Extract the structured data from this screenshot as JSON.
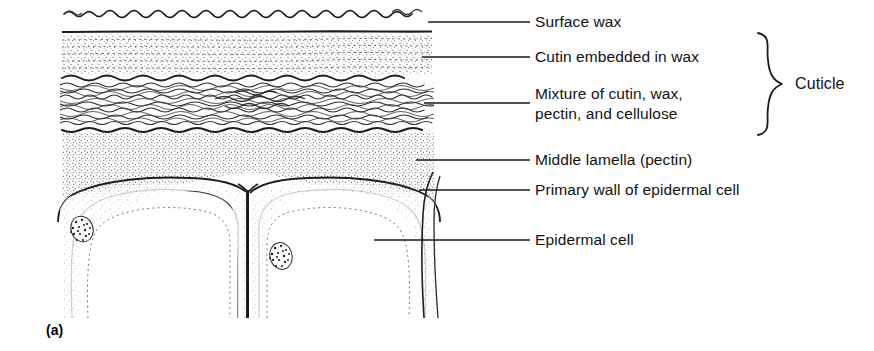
{
  "figure": {
    "panel_label": "(a)",
    "group_bracket_label": "Cuticle",
    "labels": [
      {
        "id": "surface-wax",
        "text": "Surface wax"
      },
      {
        "id": "cutin",
        "text": "Cutin embedded in wax"
      },
      {
        "id": "mixture-line1",
        "text": "Mixture of cutin, wax,"
      },
      {
        "id": "mixture-line2",
        "text": "pectin, and cellulose"
      },
      {
        "id": "middle-lamella",
        "text": "Middle lamella (pectin)"
      },
      {
        "id": "primary-wall",
        "text": "Primary wall of epidermal cell"
      },
      {
        "id": "epidermal-cell",
        "text": "Epidermal cell"
      }
    ],
    "structures": [
      {
        "id": "surface-wax-layer",
        "name": "wavy surface wax line"
      },
      {
        "id": "cutin-layer",
        "name": "stippled cutin-in-wax band"
      },
      {
        "id": "mixture-layer",
        "name": "dense wavy fiber band"
      },
      {
        "id": "pectin-layer",
        "name": "stippled middle lamella zone"
      },
      {
        "id": "epidermal-cell-left",
        "name": "left epidermal cell"
      },
      {
        "id": "epidermal-cell-right",
        "name": "right epidermal cell"
      },
      {
        "id": "nucleus-left",
        "name": "left cell nucleus"
      },
      {
        "id": "nucleus-right",
        "name": "right cell nucleus"
      },
      {
        "id": "middle-lamella-septum",
        "name": "vertical middle lamella between cells"
      }
    ],
    "colors": {
      "ink": "#111111",
      "background": "#ffffff",
      "stipple": "#4a4a4a"
    }
  }
}
